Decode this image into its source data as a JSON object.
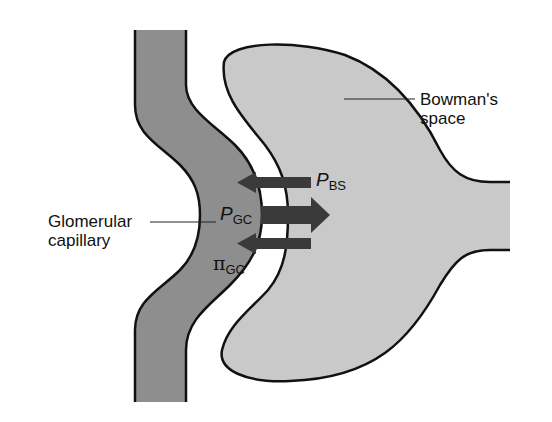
{
  "diagram": {
    "structures": [
      {
        "id": "glomerular-capillary",
        "label": "Glomerular\ncapillary",
        "fill": "#8e8e8e"
      },
      {
        "id": "bowmans-space",
        "label": "Bowman's\nspace",
        "fill": "#c9c9c9"
      }
    ],
    "labels": {
      "bowman_line1": "Bowman's",
      "bowman_line2": "space",
      "capillary_line1": "Glomerular",
      "capillary_line2": "capillary"
    },
    "forces": [
      {
        "id": "P_BS",
        "symbol": "P",
        "subscript": "BS",
        "direction": "into capillary (leftward)"
      },
      {
        "id": "P_GC",
        "symbol": "P",
        "subscript": "GC",
        "direction": "into Bowman's space (rightward)"
      },
      {
        "id": "pi_GC",
        "symbol": "π",
        "subscript": "GC",
        "direction": "into capillary (leftward)"
      }
    ],
    "colors": {
      "capillary_fill": "#8e8e8e",
      "bowman_fill": "#c9c9c9",
      "outline": "#111111",
      "arrow": "#3a3a3a",
      "membrane_gap": "#ffffff"
    }
  }
}
